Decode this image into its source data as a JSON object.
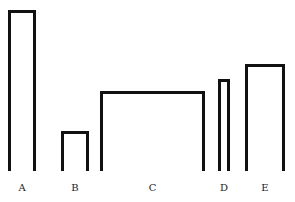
{
  "chart_data": {
    "type": "bar",
    "title": "",
    "xlabel": "",
    "ylabel": "",
    "grid": false,
    "categories": [
      "A",
      "B",
      "C",
      "D",
      "E"
    ],
    "values": [
      161,
      40,
      80,
      92,
      107
    ],
    "widths": [
      28,
      28,
      105,
      12,
      40
    ],
    "x_left": [
      8,
      61,
      100,
      218,
      245
    ],
    "baseline_y": 171,
    "style": "hand-drawn open-bottom rectangles, no axes"
  },
  "labels": [
    "A",
    "B",
    "C",
    "D",
    "E"
  ]
}
